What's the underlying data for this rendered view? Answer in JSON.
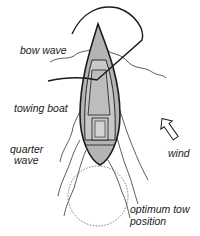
{
  "diagram": {
    "labels": {
      "bow_wave": "bow wave",
      "towing_boat": "towing boat",
      "quarter_wave_line1": "quarter",
      "quarter_wave_line2": "wave",
      "wind": "wind",
      "optimum_tow_line1": "optimum tow",
      "optimum_tow_line2": "position"
    },
    "icons": {
      "wind_direction": "wind-arrow-icon"
    },
    "colors": {
      "hull_fill": "#b4b4b4",
      "outline": "#1a1a1a",
      "wave_line": "#333333",
      "tow_circle": "#666666"
    }
  }
}
